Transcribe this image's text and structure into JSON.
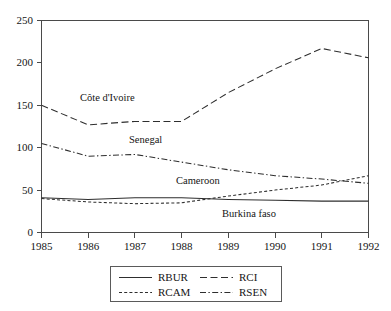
{
  "chart_data": {
    "type": "line",
    "title": "",
    "subtitle": "",
    "xlabel": "",
    "ylabel": "",
    "x": [
      1985,
      1986,
      1987,
      1988,
      1989,
      1990,
      1991,
      1992
    ],
    "categories": [
      "1985",
      "1986",
      "1987",
      "1988",
      "1989",
      "1990",
      "1991",
      "1992"
    ],
    "xlim": [
      1985,
      1992
    ],
    "ylim": [
      0,
      250
    ],
    "yticks": [
      0,
      50,
      100,
      150,
      200,
      250
    ],
    "ytick_labels": [
      "0",
      "50",
      "100",
      "150",
      "200",
      "250"
    ],
    "xtick_labels": [
      "1985",
      "1986",
      "1987",
      "1988",
      "1989",
      "1990",
      "1991",
      "1992"
    ],
    "grid": false,
    "legend_position": "bottom-center",
    "series": [
      {
        "name": "RBUR",
        "legend_label": "RBUR",
        "annotation": "Burkina faso",
        "line_style": "solid",
        "color": "#2e2e2e",
        "values": [
          41,
          39,
          41,
          41,
          39,
          38,
          37,
          37
        ]
      },
      {
        "name": "RCI",
        "legend_label": "RCI",
        "annotation": "Côte d'Ivoire",
        "line_style": "dashed",
        "color": "#2e2e2e",
        "values": [
          150,
          127,
          131,
          131,
          165,
          193,
          217,
          206
        ]
      },
      {
        "name": "RCAM",
        "legend_label": "RCAM",
        "annotation": "Cameroon",
        "line_style": "short-dash",
        "color": "#2e2e2e",
        "values": [
          40,
          36,
          34,
          35,
          43,
          50,
          56,
          67
        ]
      },
      {
        "name": "RSEN",
        "legend_label": "RSEN",
        "annotation": "Senegal",
        "line_style": "dash-dot",
        "color": "#2e2e2e",
        "values": [
          105,
          90,
          92,
          83,
          74,
          67,
          63,
          58
        ]
      }
    ],
    "annotations": [
      {
        "text": "Côte d'Ivoire",
        "x": 1986.6,
        "y": 143
      },
      {
        "text": "Senegal",
        "x": 1987.5,
        "y": 110
      },
      {
        "text": "Cameroon",
        "x": 1988.5,
        "y": 62
      },
      {
        "text": "Burkina faso",
        "x": 1990.0,
        "y": 23
      }
    ]
  },
  "axes": {
    "y_ticks": [
      "250",
      "200",
      "150",
      "100",
      "50",
      "0"
    ],
    "x_ticks": [
      "1985",
      "1986",
      "1987",
      "1988",
      "1989",
      "1990",
      "1991",
      "1992"
    ]
  },
  "legend": {
    "entries": [
      {
        "label": "RBUR",
        "style": "solid"
      },
      {
        "label": "RCI",
        "style": "dashed"
      },
      {
        "label": "RCAM",
        "style": "short-dash"
      },
      {
        "label": "RSEN",
        "style": "dash-dot"
      }
    ]
  },
  "colors": {
    "background": "#ffffff",
    "line": "#2e2e2e",
    "axis": "#4a4a4a",
    "text": "#151515"
  }
}
